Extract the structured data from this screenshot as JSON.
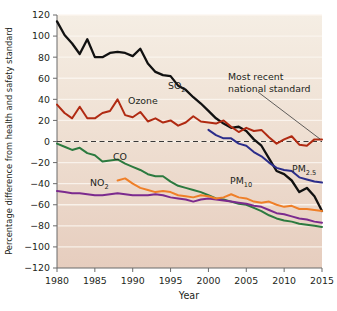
{
  "chart_data": {
    "type": "line",
    "title": "",
    "xlabel": "Year",
    "ylabel": "Percentage difference from health and safety standard",
    "xlim": [
      1980,
      2015
    ],
    "ylim": [
      -120,
      120
    ],
    "xticks": [
      1980,
      1985,
      1990,
      1995,
      2000,
      2005,
      2010,
      2015
    ],
    "yticks": [
      120,
      100,
      80,
      60,
      40,
      20,
      0,
      -20,
      -40,
      -60,
      -80,
      -100,
      -120
    ],
    "grid": "horizontal",
    "legend": "inline-labels",
    "reference_line": {
      "value": 0,
      "style": "dashed",
      "label": "Most recent national standard"
    },
    "annotations": [
      {
        "text": "Most recent national standard",
        "target_x": 2014,
        "target_y": 0
      }
    ],
    "x": [
      1980,
      1981,
      1982,
      1983,
      1984,
      1985,
      1986,
      1987,
      1988,
      1989,
      1990,
      1991,
      1992,
      1993,
      1994,
      1995,
      1996,
      1997,
      1998,
      1999,
      2000,
      2001,
      2002,
      2003,
      2004,
      2005,
      2006,
      2007,
      2008,
      2009,
      2010,
      2011,
      2012,
      2013,
      2014,
      2015
    ],
    "series": [
      {
        "name": "SO2",
        "label": "SO",
        "sub": "2",
        "color": "#111111",
        "values": [
          114,
          101,
          93,
          83,
          97,
          80,
          80,
          84,
          85,
          84,
          81,
          88,
          74,
          66,
          63,
          62,
          53,
          49,
          42,
          36,
          29,
          22,
          17,
          13,
          14,
          10,
          2,
          -4,
          -16,
          -28,
          -31,
          -37,
          -48,
          -44,
          -52,
          -66
        ]
      },
      {
        "name": "Ozone",
        "label": "Ozone",
        "sub": "",
        "color": "#b02a12",
        "values": [
          35,
          27,
          22,
          33,
          22,
          22,
          27,
          29,
          40,
          25,
          23,
          28,
          19,
          22,
          18,
          20,
          15,
          18,
          24,
          19,
          18,
          17,
          20,
          14,
          9,
          13,
          10,
          11,
          4,
          -2,
          2,
          5,
          -3,
          -4,
          2,
          2
        ]
      },
      {
        "name": "CO",
        "label": "CO",
        "sub": "",
        "color": "#2c7a3f",
        "values": [
          -2,
          -5,
          -8,
          -6,
          -11,
          -13,
          -19,
          -18,
          -17,
          -21,
          -24,
          -27,
          -31,
          -33,
          -33,
          -38,
          -42,
          -44,
          -46,
          -48,
          -51,
          -54,
          -55,
          -57,
          -59,
          -60,
          -63,
          -66,
          -70,
          -73,
          -75,
          -76,
          -78,
          -79,
          -80,
          -81
        ]
      },
      {
        "name": "NO2",
        "label": "NO",
        "sub": "2",
        "color": "#7b2a8e",
        "values": [
          -47,
          -48,
          -49,
          -49,
          -50,
          -51,
          -51,
          -50,
          -49,
          -50,
          -51,
          -51,
          -51,
          -50,
          -51,
          -53,
          -54,
          -55,
          -57,
          -55,
          -54,
          -55,
          -56,
          -57,
          -58,
          -59,
          -61,
          -62,
          -65,
          -68,
          -69,
          -71,
          -73,
          -74,
          -76,
          -77
        ]
      },
      {
        "name": "PM10",
        "label": "PM",
        "sub": "10",
        "color": "#ef7f28",
        "values": [
          null,
          null,
          null,
          null,
          null,
          null,
          null,
          null,
          -37,
          -35,
          -40,
          -44,
          -46,
          -48,
          -47,
          -48,
          -51,
          -52,
          -53,
          -51,
          -52,
          -54,
          -53,
          -50,
          -53,
          -54,
          -57,
          -58,
          -57,
          -60,
          -62,
          -61,
          -64,
          -64,
          -65,
          -66
        ]
      },
      {
        "name": "PM2.5",
        "label": "PM",
        "sub": "2.5",
        "color": "#2b2d8a",
        "values": [
          null,
          null,
          null,
          null,
          null,
          null,
          null,
          null,
          null,
          null,
          null,
          null,
          null,
          null,
          null,
          null,
          null,
          null,
          null,
          null,
          11,
          6,
          3,
          3,
          -2,
          -4,
          -10,
          -14,
          -20,
          -25,
          -27,
          -28,
          -34,
          -36,
          -38,
          -39
        ]
      }
    ],
    "series_label_positions": [
      {
        "name": "SO2",
        "x": 168,
        "y": 89
      },
      {
        "name": "Ozone",
        "x": 128,
        "y": 104
      },
      {
        "name": "CO",
        "x": 113,
        "y": 160
      },
      {
        "name": "NO2",
        "x": 90,
        "y": 186
      },
      {
        "name": "PM10",
        "x": 230,
        "y": 184
      },
      {
        "name": "PM2.5",
        "x": 292,
        "y": 172
      }
    ]
  },
  "style": {
    "plot_bg_top": "#f4ece1",
    "plot_bg_bottom": "#e7cfc1",
    "gridline": "#faf5ee",
    "axis": "#6b6b6b",
    "page_bg": "#ffffff"
  }
}
